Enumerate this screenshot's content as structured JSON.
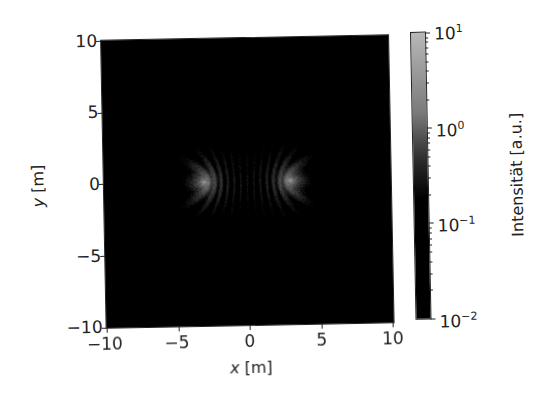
{
  "chart_data": {
    "type": "heatmap",
    "title": "",
    "xlabel": "x [m]",
    "ylabel": "y [m]",
    "xlabel_var": "x",
    "ylabel_var": "y",
    "unit": "[m]",
    "xlim": [
      -10,
      10
    ],
    "ylim": [
      -10,
      10
    ],
    "xticks": [
      "−10",
      "−5",
      "0",
      "5",
      "10"
    ],
    "yticks": [
      "10",
      "5",
      "0",
      "−5",
      "−10"
    ],
    "grid": false,
    "colormap": "gray",
    "colorbar": {
      "label": "Intensität [a.u.]",
      "scale": "log",
      "range": [
        0.01,
        10
      ],
      "ticks": [
        {
          "base": "10",
          "exp": "1"
        },
        {
          "base": "10",
          "exp": "0"
        },
        {
          "base": "10",
          "exp": "−1"
        },
        {
          "base": "10",
          "exp": "−2"
        }
      ]
    },
    "sources": [
      {
        "x": -3.0,
        "y": 0.0
      },
      {
        "x": 3.0,
        "y": 0.0
      }
    ],
    "wavelength_m": 0.9,
    "peak_intensity_near_sources": 6
  },
  "colors": {
    "colormap_top": "#b8b8b8",
    "colormap_bottom": "#000000",
    "axis": "#222222",
    "background": "#ffffff"
  }
}
